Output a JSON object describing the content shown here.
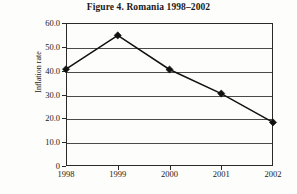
{
  "figure": {
    "title": "Figure 4.  Romania 1998–2002",
    "background_color": "#fdfdfb",
    "frame_color": "#2a2a2a",
    "grid_color": "#4a4a4a",
    "series_color": "#111111"
  },
  "chart_data": {
    "type": "line",
    "title": "Figure 4.  Romania 1998–2002",
    "xlabel": "",
    "ylabel": "Inflation rate",
    "categories": [
      "1998",
      "1999",
      "2000",
      "2001",
      "2002"
    ],
    "values": [
      40.6,
      54.8,
      40.5,
      30.4,
      18.3
    ],
    "series": [
      {
        "name": "Inflation rate",
        "values": [
          40.6,
          54.8,
          40.5,
          30.4,
          18.3
        ],
        "marker": "diamond",
        "marker_color": "#111111",
        "line_color": "#111111"
      }
    ],
    "ylim": [
      0,
      60
    ],
    "y_ticks": [
      0,
      10,
      20,
      30,
      40,
      50,
      60
    ],
    "y_tick_labels": [
      "0",
      "10.0",
      "20.0",
      "30.0",
      "40.0",
      "50.0",
      "60.0"
    ],
    "x_tick_labels": [
      "1998",
      "1999",
      "2000",
      "2001",
      "2002"
    ],
    "grid": true,
    "grid_axis": "y",
    "legend": false,
    "legend_position": "none"
  }
}
